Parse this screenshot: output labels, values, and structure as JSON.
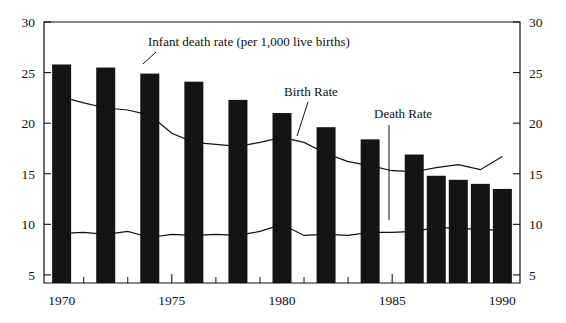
{
  "chart_data": {
    "type": "bar",
    "title": "",
    "subtitle": "",
    "xlabel": "",
    "ylabel": "",
    "ylim": [
      0,
      30
    ],
    "xlim": [
      1969.2,
      1990.8
    ],
    "y_ticks": [
      5,
      10,
      15,
      20,
      25,
      30
    ],
    "y_ticks_right": [
      5,
      10,
      15,
      20,
      25,
      30
    ],
    "x_ticks_major": [
      1970,
      1975,
      1980,
      1985,
      1990
    ],
    "x_ticks_minor": [
      1971,
      1972,
      1973,
      1974,
      1976,
      1977,
      1978,
      1979,
      1981,
      1982,
      1983,
      1984,
      1986,
      1987,
      1988,
      1989
    ],
    "x_tick_labels": [
      "1970",
      "1975",
      "1980",
      "1985",
      "1990"
    ],
    "grid": false,
    "legend_position": "inline-annotations",
    "bars": {
      "name": "Infant death rate (per 1,000 live births)",
      "x": [
        1970,
        1972,
        1974,
        1976,
        1978,
        1980,
        1982,
        1984,
        1986,
        1987,
        1988,
        1989,
        1990
      ],
      "values": [
        25.8,
        25.5,
        24.9,
        24.1,
        22.3,
        21.0,
        19.6,
        18.4,
        16.9,
        14.8,
        14.4,
        14.0,
        13.5
      ],
      "color": "#141414"
    },
    "series": [
      {
        "name": "Birth Rate",
        "type": "line",
        "x": [
          1970,
          1971,
          1972,
          1973,
          1974,
          1975,
          1976,
          1977,
          1978,
          1979,
          1980,
          1981,
          1982,
          1983,
          1984,
          1985,
          1986,
          1987,
          1988,
          1989,
          1990
        ],
        "values": [
          22.6,
          22.0,
          21.5,
          21.3,
          20.8,
          19.0,
          18.1,
          17.9,
          17.7,
          18.1,
          18.6,
          18.1,
          17.0,
          16.2,
          15.8,
          15.3,
          15.2,
          15.6,
          15.9,
          15.4,
          16.7
        ],
        "color": "#111111"
      },
      {
        "name": "Death Rate",
        "type": "line",
        "x": [
          1970,
          1971,
          1972,
          1973,
          1974,
          1975,
          1976,
          1977,
          1978,
          1979,
          1980,
          1981,
          1982,
          1983,
          1984,
          1985,
          1986,
          1987,
          1988,
          1989,
          1990
        ],
        "values": [
          9.1,
          9.2,
          9.0,
          9.3,
          8.7,
          9.0,
          8.9,
          9.0,
          8.9,
          9.3,
          10.0,
          8.9,
          9.0,
          8.9,
          9.2,
          9.2,
          9.3,
          9.7,
          9.6,
          9.5,
          9.4
        ],
        "color": "#111111"
      }
    ],
    "annotations": [
      {
        "text": "Infant death rate (per 1,000 live births)",
        "target": "bars",
        "text_x": 148,
        "text_y": 46,
        "leader_from_x": 156,
        "leader_from_y": 52,
        "leader_to_x": 143,
        "leader_to_y": 64
      },
      {
        "text": "Birth Rate",
        "target": "Birth Rate",
        "text_x": 284,
        "text_y": 96,
        "leader_from_x": 308,
        "leader_from_y": 102,
        "leader_to_x": 297,
        "leader_to_y": 136
      },
      {
        "text": "Death Rate",
        "target": "Death Rate",
        "text_x": 374,
        "text_y": 118,
        "leader_from_x": 389,
        "leader_from_y": 125,
        "leader_to_x": 389,
        "leader_to_y": 220
      }
    ]
  }
}
